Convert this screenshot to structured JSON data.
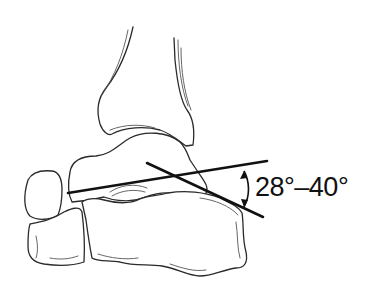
{
  "diagram": {
    "angle_label": "28°–40°",
    "colors": {
      "background": "#ffffff",
      "line_art": "#2a2a2a",
      "reference_lines": "#111111"
    },
    "parts": [
      "tibia",
      "talus",
      "calcaneus",
      "navicular",
      "cuboid",
      "angle-lines",
      "angle-arc"
    ]
  }
}
